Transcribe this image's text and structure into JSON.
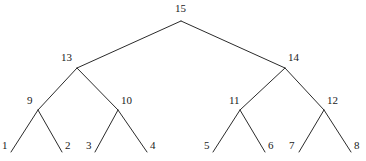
{
  "figure": {
    "name": "complete-binary-tree",
    "background_color": "#ffffff",
    "edge_color": "#2b2b2b",
    "label_color": "#1a1a1a",
    "width": 366,
    "height": 161
  },
  "chart_data": {
    "type": "diagram",
    "diagram_kind": "binary-tree",
    "title": "",
    "xlabel": "",
    "ylabel": "",
    "grid": false,
    "legend": null,
    "node_count": 15,
    "leaf_count": 8,
    "depth": 4,
    "nodes": [
      {
        "id": "n15",
        "label": "15",
        "level": 0,
        "x": 181,
        "y": 21,
        "label_x": 175,
        "label_y": 3
      },
      {
        "id": "n13",
        "label": "13",
        "level": 1,
        "x": 77,
        "y": 68,
        "label_x": 61,
        "label_y": 52
      },
      {
        "id": "n14",
        "label": "14",
        "level": 1,
        "x": 285,
        "y": 68,
        "label_x": 288,
        "label_y": 52
      },
      {
        "id": "n9",
        "label": "9",
        "level": 2,
        "x": 38,
        "y": 110,
        "label_x": 27,
        "label_y": 95
      },
      {
        "id": "n10",
        "label": "10",
        "level": 2,
        "x": 118,
        "y": 110,
        "label_x": 121,
        "label_y": 95
      },
      {
        "id": "n11",
        "label": "11",
        "level": 2,
        "x": 240,
        "y": 110,
        "label_x": 229,
        "label_y": 95
      },
      {
        "id": "n12",
        "label": "12",
        "level": 2,
        "x": 324,
        "y": 110,
        "label_x": 327,
        "label_y": 95
      },
      {
        "id": "n1",
        "label": "1",
        "level": 3,
        "x": 11,
        "y": 152,
        "label_x": 2,
        "label_y": 140
      },
      {
        "id": "n2",
        "label": "2",
        "level": 3,
        "x": 62,
        "y": 152,
        "label_x": 65,
        "label_y": 140
      },
      {
        "id": "n3",
        "label": "3",
        "level": 3,
        "x": 95,
        "y": 152,
        "label_x": 86,
        "label_y": 140
      },
      {
        "id": "n4",
        "label": "4",
        "level": 3,
        "x": 147,
        "y": 152,
        "label_x": 150,
        "label_y": 140
      },
      {
        "id": "n5",
        "label": "5",
        "level": 3,
        "x": 213,
        "y": 152,
        "label_x": 204,
        "label_y": 140
      },
      {
        "id": "n6",
        "label": "6",
        "level": 3,
        "x": 265,
        "y": 152,
        "label_x": 268,
        "label_y": 140
      },
      {
        "id": "n7",
        "label": "7",
        "level": 3,
        "x": 299,
        "y": 152,
        "label_x": 289,
        "label_y": 140
      },
      {
        "id": "n8",
        "label": "8",
        "level": 3,
        "x": 351,
        "y": 152,
        "label_x": 354,
        "label_y": 140
      }
    ],
    "edges": [
      {
        "from": "n15",
        "to": "n13"
      },
      {
        "from": "n15",
        "to": "n14"
      },
      {
        "from": "n13",
        "to": "n9"
      },
      {
        "from": "n13",
        "to": "n10"
      },
      {
        "from": "n14",
        "to": "n11"
      },
      {
        "from": "n14",
        "to": "n12"
      },
      {
        "from": "n9",
        "to": "n1"
      },
      {
        "from": "n9",
        "to": "n2"
      },
      {
        "from": "n10",
        "to": "n3"
      },
      {
        "from": "n10",
        "to": "n4"
      },
      {
        "from": "n11",
        "to": "n5"
      },
      {
        "from": "n11",
        "to": "n6"
      },
      {
        "from": "n12",
        "to": "n7"
      },
      {
        "from": "n12",
        "to": "n8"
      }
    ]
  }
}
